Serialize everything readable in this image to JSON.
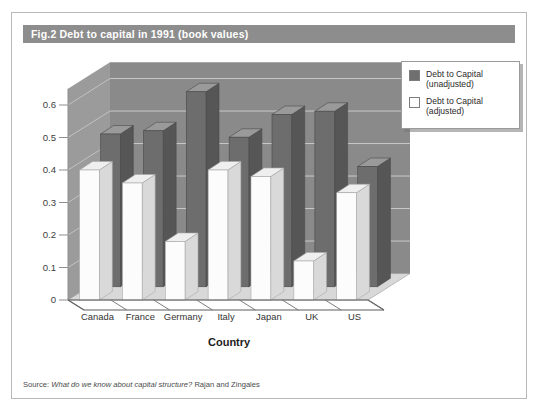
{
  "figure": {
    "number": "Fig.2",
    "title": "Debt to capital in 1991 (book values)"
  },
  "source": {
    "lead": "Source: ",
    "title": "What do we know about capital structure?",
    "authors": " Rajan and Zingales"
  },
  "legend": {
    "position": "top-right",
    "items": [
      {
        "label": "Debt to Capital\n(unadjusted)",
        "color": "#6f6f6f"
      },
      {
        "label": "Debt to Capital\n(adjusted)",
        "color": "#fdfdfd"
      }
    ]
  },
  "colors": {
    "banner": "#8d8d8d",
    "back_wall": "#8a8a8a",
    "side_wall": "#9b9b9b",
    "floor": "#d8d8d8",
    "gridline": "#bdbdbd",
    "bar_unadjusted_front": "#6d6d6d",
    "bar_unadjusted_side": "#565656",
    "bar_unadjusted_top": "#9a9a9a",
    "bar_adjusted_front": "#fcfcfc",
    "bar_adjusted_side": "#d9d9d9",
    "bar_adjusted_top": "#efefef",
    "frame_border": "#b9b9b9"
  },
  "chart_data": {
    "type": "bar",
    "title": "Debt to capital in 1991 (book values)",
    "xlabel": "Country",
    "ylabel": "",
    "categories": [
      "Canada",
      "France",
      "Germany",
      "Italy",
      "Japan",
      "UK",
      "US"
    ],
    "series": [
      {
        "name": "Debt to Capital (unadjusted)",
        "values": [
          0.47,
          0.48,
          0.6,
          0.46,
          0.53,
          0.54,
          0.37
        ]
      },
      {
        "name": "Debt to Capital (adjusted)",
        "values": [
          0.4,
          0.36,
          0.18,
          0.4,
          0.38,
          0.12,
          0.33
        ]
      }
    ],
    "ylim": [
      0,
      0.65
    ],
    "yticks": [
      0,
      0.1,
      0.2,
      0.3,
      0.4,
      0.5,
      0.6
    ],
    "ytick_labels": [
      "0",
      "0.1",
      "0.2",
      "0.3",
      "0.4",
      "0.5",
      "0.6"
    ],
    "grid": true,
    "projection": "3d",
    "legend_position": "top-right"
  }
}
